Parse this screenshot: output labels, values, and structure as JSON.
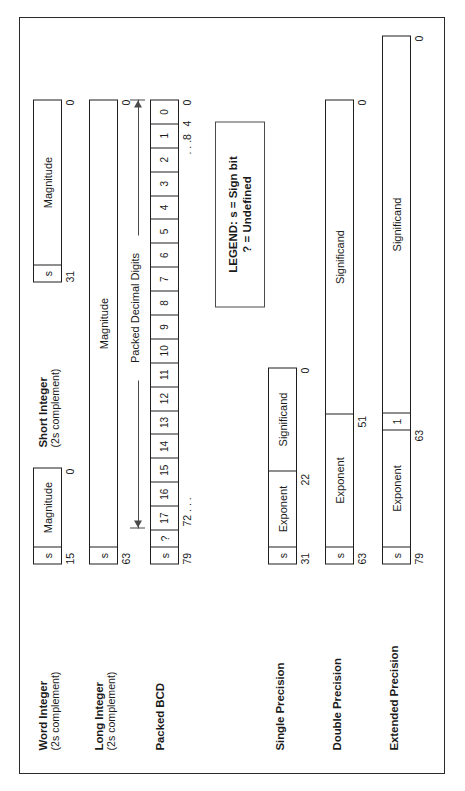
{
  "figure": {
    "legend": {
      "line1": "LEGEND: s = Sign bit",
      "line2": "? = Undefined"
    },
    "packed_decimal_caption": "Packed Decimal Digits",
    "formats": [
      {
        "id": "word-integer",
        "name": "Word Integer",
        "sub": "(2s complement)",
        "fields": [
          {
            "label": "s",
            "kind": "sign"
          },
          {
            "label": "Magnitude",
            "kind": "magnitude"
          }
        ],
        "bits": {
          "left": "15",
          "right": "0"
        }
      },
      {
        "id": "short-integer",
        "name": "Short Integer",
        "sub": "(2s complement)",
        "fields": [
          {
            "label": "s",
            "kind": "sign"
          },
          {
            "label": "Magnitude",
            "kind": "magnitude"
          }
        ],
        "bits": {
          "left": "31",
          "right": "0"
        }
      },
      {
        "id": "long-integer",
        "name": "Long Integer",
        "sub": "(2s complement)",
        "fields": [
          {
            "label": "s",
            "kind": "sign"
          },
          {
            "label": "Magnitude",
            "kind": "magnitude"
          }
        ],
        "bits": {
          "left": "63",
          "right": "0"
        }
      },
      {
        "id": "packed-bcd",
        "name": "Packed BCD",
        "sub": "",
        "fields": [
          {
            "label": "s",
            "kind": "sign"
          },
          {
            "label": "?",
            "kind": "undefined"
          },
          {
            "label": "17",
            "kind": "digit"
          },
          {
            "label": "16",
            "kind": "digit"
          },
          {
            "label": "15",
            "kind": "digit"
          },
          {
            "label": "14",
            "kind": "digit"
          },
          {
            "label": "13",
            "kind": "digit"
          },
          {
            "label": "12",
            "kind": "digit"
          },
          {
            "label": "11",
            "kind": "digit"
          },
          {
            "label": "10",
            "kind": "digit"
          },
          {
            "label": "9",
            "kind": "digit"
          },
          {
            "label": "8",
            "kind": "digit"
          },
          {
            "label": "7",
            "kind": "digit"
          },
          {
            "label": "6",
            "kind": "digit"
          },
          {
            "label": "5",
            "kind": "digit"
          },
          {
            "label": "4",
            "kind": "digit"
          },
          {
            "label": "3",
            "kind": "digit"
          },
          {
            "label": "2",
            "kind": "digit"
          },
          {
            "label": "1",
            "kind": "digit"
          },
          {
            "label": "0",
            "kind": "digit"
          }
        ],
        "bits": {
          "b79": "79",
          "b72": "72 . . .",
          "b8": ". . .8",
          "b4": "4",
          "b0": "0"
        }
      },
      {
        "id": "single-precision",
        "name": "Single Precision",
        "sub": "",
        "fields": [
          {
            "label": "s",
            "kind": "sign"
          },
          {
            "label": "Exponent",
            "kind": "exponent"
          },
          {
            "label": "Significand",
            "kind": "significand"
          }
        ],
        "bits": {
          "left": "31",
          "mid": "22",
          "right": "0"
        }
      },
      {
        "id": "double-precision",
        "name": "Double Precision",
        "sub": "",
        "fields": [
          {
            "label": "s",
            "kind": "sign"
          },
          {
            "label": "Exponent",
            "kind": "exponent"
          },
          {
            "label": "Significand",
            "kind": "significand"
          }
        ],
        "bits": {
          "left": "63",
          "mid": "51",
          "right": "0"
        }
      },
      {
        "id": "extended-precision",
        "name": "Extended Precision",
        "sub": "",
        "fields": [
          {
            "label": "s",
            "kind": "sign"
          },
          {
            "label": "Exponent",
            "kind": "exponent"
          },
          {
            "label": "1",
            "kind": "integer-bit"
          },
          {
            "label": "Significand",
            "kind": "significand"
          }
        ],
        "bits": {
          "left": "79",
          "mid": "63",
          "right": "0"
        }
      }
    ]
  }
}
